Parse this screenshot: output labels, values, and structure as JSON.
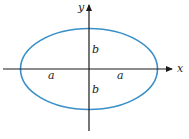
{
  "diagram": {
    "type": "ellipse-axes",
    "colors": {
      "ellipse": "#3a8fc8",
      "axes": "#1a1a1a",
      "labels": "#222222"
    },
    "axes": {
      "x_label": "x",
      "y_label": "y"
    },
    "labels": {
      "semi_minor_top": "b",
      "semi_minor_bottom": "b",
      "semi_major_left": "a",
      "semi_major_right": "a"
    }
  }
}
